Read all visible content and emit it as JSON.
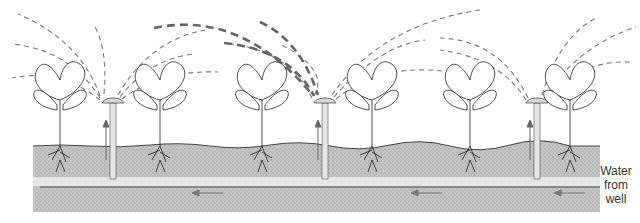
{
  "diagram": {
    "type": "irrigation-sprinkler-cross-section",
    "colors": {
      "background": "#ffffff",
      "soil": "#b8b8b8",
      "pipe": "#e6e6e6",
      "outline": "#222222",
      "spray": "#777777",
      "spray_highlight": "#666666",
      "arrow": "#666666"
    },
    "label": {
      "lines": [
        "Water",
        "from",
        "well"
      ]
    },
    "plants": [
      {
        "x": 60
      },
      {
        "x": 160
      },
      {
        "x": 260
      },
      {
        "x": 370
      },
      {
        "x": 470
      },
      {
        "x": 570
      }
    ],
    "sprinklers": [
      {
        "x": 113
      },
      {
        "x": 325
      },
      {
        "x": 537
      }
    ],
    "flow_arrows": [
      {
        "x1": 223,
        "x2": 193,
        "y": 193
      },
      {
        "x1": 442,
        "x2": 412,
        "y": 193
      },
      {
        "x1": 585,
        "x2": 555,
        "y": 193
      }
    ]
  }
}
